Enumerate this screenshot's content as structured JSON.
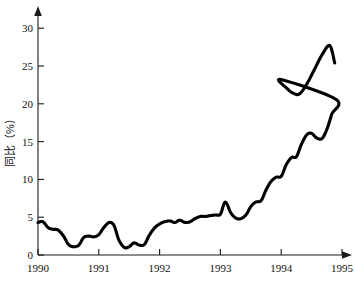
{
  "chart_data": {
    "type": "line",
    "title": "",
    "subtitle": "",
    "xlabel": "",
    "ylabel": "同比（%）",
    "xlim": [
      1990.0,
      1995.0
    ],
    "ylim": [
      0,
      32
    ],
    "grid": false,
    "legend": null,
    "x_tick_labels": [
      "1990",
      "1991",
      "1992",
      "1993",
      "1994",
      "1995"
    ],
    "x_tick_values": [
      1990,
      1991,
      1992,
      1993,
      1994,
      1995
    ],
    "y_tick_labels": [
      "0",
      "5",
      "10",
      "15",
      "20",
      "25",
      "30"
    ],
    "y_tick_values": [
      0,
      5,
      10,
      15,
      20,
      25,
      30
    ],
    "axis_style": "L-shaped with arrowheads",
    "series": [
      {
        "name": "同比（%）",
        "color": "#000000",
        "x": [
          1990.0,
          1990.08,
          1990.17,
          1990.25,
          1990.33,
          1990.42,
          1990.5,
          1990.58,
          1990.67,
          1990.75,
          1990.83,
          1990.92,
          1991.0,
          1991.08,
          1991.17,
          1991.25,
          1991.33,
          1991.42,
          1991.5,
          1991.58,
          1991.67,
          1991.75,
          1991.83,
          1991.92,
          1992.0,
          1992.08,
          1992.17,
          1992.25,
          1992.33,
          1992.42,
          1992.5,
          1992.58,
          1992.67,
          1992.75,
          1992.83,
          1992.92,
          1993.0,
          1993.08,
          1993.17,
          1993.25,
          1993.33,
          1993.42,
          1993.5,
          1993.58,
          1993.67,
          1993.75,
          1993.83,
          1993.92,
          1994.0,
          1994.08,
          1994.17,
          1994.25,
          1994.33,
          1994.42,
          1994.5,
          1994.58,
          1994.67,
          1994.75,
          1994.83,
          1994.9
        ],
        "values": [
          4.3,
          4.4,
          3.6,
          3.4,
          3.3,
          2.5,
          1.4,
          1.1,
          1.3,
          2.3,
          2.5,
          2.4,
          2.7,
          3.6,
          4.3,
          3.9,
          2.0,
          1.0,
          1.1,
          1.6,
          1.3,
          1.4,
          2.6,
          3.6,
          4.1,
          4.4,
          4.5,
          4.3,
          4.6,
          4.3,
          4.4,
          4.8,
          5.1,
          5.1,
          5.2,
          5.3,
          5.4,
          7.0,
          5.6,
          4.9,
          4.8,
          5.3,
          6.4,
          7.0,
          7.2,
          8.6,
          9.7,
          10.3,
          10.4,
          11.9,
          12.9,
          13.0,
          14.6,
          15.9,
          16.1,
          15.5,
          15.4,
          16.6,
          18.6,
          20.6
        ]
      }
    ],
    "series_extension": {
      "x": [
        1994.0,
        1994.1,
        1994.2,
        1994.3,
        1994.42,
        1994.55,
        1994.68,
        1994.8,
        1994.88
      ],
      "values": [
        23.2,
        22.0,
        21.4,
        21.3,
        22.6,
        24.6,
        26.6,
        27.7,
        25.4
      ]
    },
    "annotations": []
  },
  "axis": {
    "y_title": "同比（%）",
    "y_title_chars": [
      "同",
      "比",
      "（",
      "%",
      "）"
    ],
    "origin_label": "0"
  }
}
